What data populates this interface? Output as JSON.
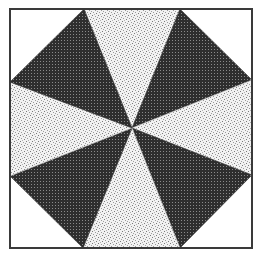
{
  "figure": {
    "colors": {
      "background": "#ffffff",
      "border": "#3a3a3a",
      "dark_wedge": "#2e2e2e",
      "dark_wedge_dot": "#8a8a8a",
      "light_wedge": "#f2f2f2",
      "light_wedge_speck": "#7a7a7a",
      "corner_fill": "#ffffff"
    },
    "frame": {
      "x1": 10,
      "y1": 9,
      "x2": 252,
      "y2": 248
    },
    "center": {
      "x": 132,
      "y": 128
    },
    "octagon_vertices": [
      {
        "x": 84,
        "y": 9
      },
      {
        "x": 180,
        "y": 9
      },
      {
        "x": 252,
        "y": 80
      },
      {
        "x": 252,
        "y": 175
      },
      {
        "x": 180,
        "y": 248
      },
      {
        "x": 83,
        "y": 248
      },
      {
        "x": 10,
        "y": 176
      },
      {
        "x": 10,
        "y": 82
      }
    ],
    "wedge_pattern": [
      "light",
      "dark",
      "light",
      "dark",
      "light",
      "dark",
      "light",
      "dark"
    ]
  }
}
